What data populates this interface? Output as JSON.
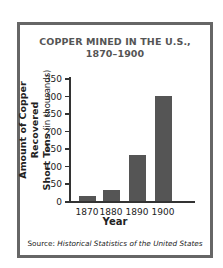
{
  "chart_data": {
    "type": "bar",
    "title": "COPPER MINED IN THE U.S., 1870–1900",
    "title_lines": [
      "COPPER MINED IN THE U.S.,",
      "1870–1900"
    ],
    "xlabel": "Year",
    "ylabel": "Amount of Copper Recovered Short Tons (in thousands)",
    "ylabel_lines": {
      "line1": "Amount of Copper Recovered",
      "line2_bold": "Short Tons",
      "line2_rest": " (in thousands)"
    },
    "categories": [
      "1870",
      "1880",
      "1890",
      "1900"
    ],
    "values": [
      15,
      30,
      130,
      300
    ],
    "ylim": [
      0,
      350
    ],
    "yticks": [
      0,
      50,
      100,
      150,
      200,
      250,
      300,
      350
    ],
    "grid": false,
    "bar_color": "#555555",
    "source_label": "Source:",
    "source_text": "Historical Statistics of the United States"
  }
}
